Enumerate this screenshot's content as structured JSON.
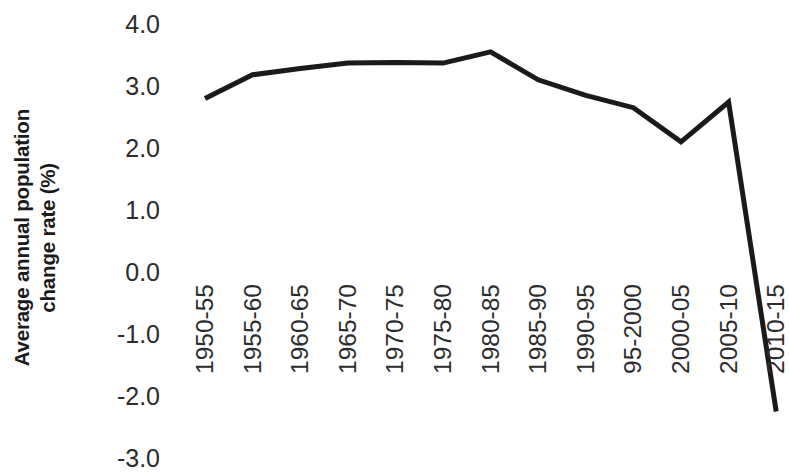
{
  "chart_data": {
    "type": "line",
    "title": "",
    "xlabel": "",
    "ylabel": "Average annual population change rate (%)",
    "ylabel_lines": [
      "Average annual population",
      "change rate (%)"
    ],
    "categories": [
      "1950-55",
      "1955-60",
      "1960-65",
      "1965-70",
      "1970-75",
      "1975-80",
      "1980-85",
      "1985-90",
      "1990-95",
      "95-2000",
      "2000-05",
      "2005-10",
      "2010-15"
    ],
    "values": [
      2.8,
      3.18,
      3.28,
      3.37,
      3.38,
      3.37,
      3.55,
      3.1,
      2.85,
      2.65,
      2.1,
      2.74,
      -2.25
    ],
    "series": [
      {
        "name": "Average annual population change rate",
        "values": [
          2.8,
          3.18,
          3.28,
          3.37,
          3.38,
          3.37,
          3.55,
          3.1,
          2.85,
          2.65,
          2.1,
          2.74,
          -2.25
        ]
      }
    ],
    "y_ticks": [
      4.0,
      3.0,
      2.0,
      1.0,
      0.0,
      -1.0,
      -2.0,
      -3.0
    ],
    "y_tick_labels": [
      "4.0",
      "3.0",
      "2.0",
      "1.0",
      "0.0",
      "-1.0",
      "-2.0",
      "-3.0"
    ],
    "ylim": [
      -3.0,
      4.0
    ],
    "grid": false,
    "legend": false,
    "legend_position": "none",
    "line_color": "#1a1a1a",
    "line_width": 5,
    "background_color": "#ffffff",
    "x_tick_label_rotation": 90
  }
}
